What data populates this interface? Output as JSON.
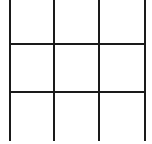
{
  "game": {
    "type": "tic-tac-toe",
    "rows": 3,
    "cols": 3,
    "line_color": "#1a1a1a",
    "background_color": "#ffffff",
    "cells": [
      [
        "",
        "",
        ""
      ],
      [
        "",
        "",
        ""
      ],
      [
        "",
        "",
        ""
      ]
    ]
  }
}
